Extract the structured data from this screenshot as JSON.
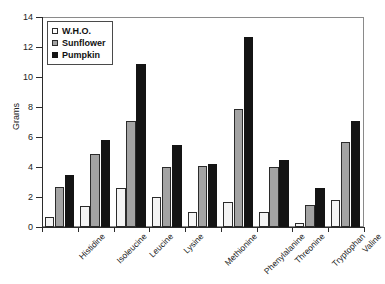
{
  "chart_data": {
    "type": "bar",
    "title": "",
    "xlabel": "",
    "ylabel": "Grams",
    "ylim": [
      0,
      14
    ],
    "yticks": [
      0,
      2,
      4,
      6,
      8,
      10,
      12,
      14
    ],
    "grid": false,
    "legend_position": "top-left inside plot",
    "categories": [
      "Histidine",
      "Isoleucine",
      "Leucine",
      "Lysine",
      "Methionine",
      "Phenylalanine",
      "Threonine",
      "Tryptophan",
      "Valine"
    ],
    "series": [
      {
        "name": "W.H.O.",
        "color": "#f4f4f4",
        "values": [
          0.7,
          1.4,
          2.6,
          2.0,
          1.0,
          1.7,
          1.0,
          0.3,
          1.8
        ]
      },
      {
        "name": "Sunflower",
        "color": "#a3a3a3",
        "values": [
          2.7,
          4.9,
          7.1,
          4.0,
          4.1,
          7.9,
          4.0,
          1.5,
          5.7
        ]
      },
      {
        "name": "Pumpkin",
        "color": "#141414",
        "values": [
          3.5,
          5.8,
          10.9,
          5.5,
          4.2,
          12.7,
          4.5,
          2.6,
          7.1
        ]
      }
    ]
  },
  "axis": {
    "y_title": "Grams"
  },
  "legend": {
    "items": [
      {
        "label": "W.H.O.",
        "swatch": "who"
      },
      {
        "label": "Sunflower",
        "swatch": "sunflower"
      },
      {
        "label": "Pumpkin",
        "swatch": "pumpkin"
      }
    ]
  }
}
